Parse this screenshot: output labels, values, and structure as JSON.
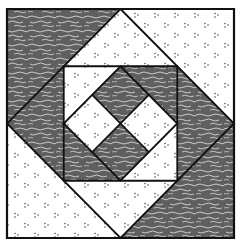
{
  "colors": {
    "background": "#ffffff",
    "dark_fabric": "#5f5f5f",
    "dark_streak": "#c9c9c9",
    "light_fabric": "#ffffff",
    "light_speck": "#3a3a3a",
    "outline": "#111111"
  },
  "fabrics": {
    "dark": "wavy-streak",
    "light": "speckled"
  },
  "block": {
    "layers": [
      {
        "name": "outer-corner-triangles",
        "pieces": [
          {
            "name": "top-left",
            "fabric": "dark"
          },
          {
            "name": "top-right",
            "fabric": "light"
          },
          {
            "name": "bottom-right",
            "fabric": "dark"
          },
          {
            "name": "bottom-left",
            "fabric": "light"
          }
        ]
      },
      {
        "name": "diamond-side-triangles",
        "pieces": [
          {
            "name": "top",
            "fabric": "light"
          },
          {
            "name": "right",
            "fabric": "dark"
          },
          {
            "name": "bottom",
            "fabric": "light"
          },
          {
            "name": "left",
            "fabric": "dark"
          }
        ]
      },
      {
        "name": "inner-square-corner-triangles",
        "pieces": [
          {
            "name": "top-left",
            "fabric": "light"
          },
          {
            "name": "top-right",
            "fabric": "dark"
          },
          {
            "name": "bottom-right",
            "fabric": "light"
          },
          {
            "name": "bottom-left",
            "fabric": "dark"
          }
        ]
      },
      {
        "name": "center-four-patch",
        "pieces": [
          {
            "name": "top",
            "fabric": "dark"
          },
          {
            "name": "right",
            "fabric": "light"
          },
          {
            "name": "bottom",
            "fabric": "dark"
          },
          {
            "name": "left",
            "fabric": "light"
          }
        ]
      }
    ]
  }
}
